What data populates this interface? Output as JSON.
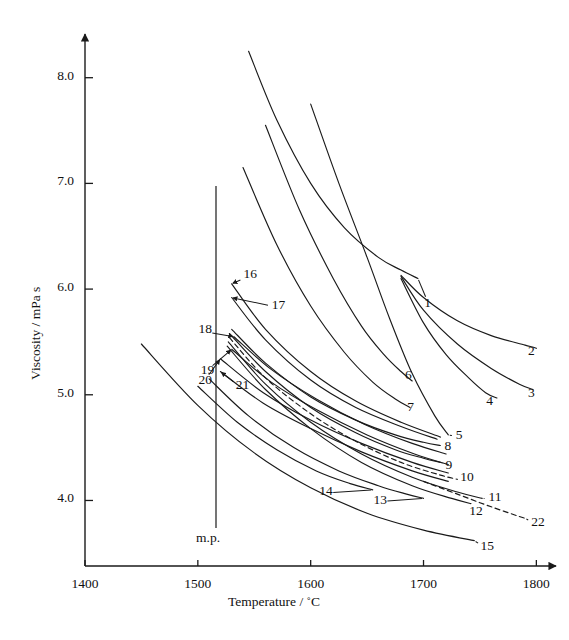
{
  "figure": {
    "kind": "scientific-line-chart",
    "background": "#ffffff",
    "ink": "#1a1a1a"
  },
  "axes": {
    "x_title": "Temperature / ˚C",
    "y_title": "Viscosity / mPa s",
    "x_ticks": [
      "1400",
      "1500",
      "1600",
      "1700",
      "1800"
    ],
    "y_ticks": [
      "8.0",
      "7.0",
      "6.0",
      "5.0",
      "4.0"
    ]
  },
  "annotations": {
    "melting_point": "m.p."
  },
  "curve_labels": [
    "1",
    "2",
    "3",
    "4",
    "5",
    "6",
    "7",
    "8",
    "9",
    "10",
    "11",
    "12",
    "13",
    "14",
    "15",
    "16",
    "17",
    "18",
    "19",
    "20",
    "21",
    "22"
  ],
  "chart_data": {
    "type": "line",
    "title": "",
    "xlabel": "Temperature / ˚C",
    "ylabel": "Viscosity / mPa s",
    "xlim": [
      1400,
      1800
    ],
    "ylim": [
      3.4,
      8.3
    ],
    "xticks": [
      1400,
      1500,
      1600,
      1700,
      1800
    ],
    "yticks": [
      4.0,
      5.0,
      6.0,
      7.0,
      8.0
    ],
    "grid": false,
    "legend": "inline-end-labels",
    "annotations": [
      {
        "text": "m.p.",
        "x": 1537,
        "note": "vertical melting-point line"
      }
    ],
    "series": [
      {
        "name": "1",
        "style": "solid",
        "label_xy": [
          1705,
          5.85
        ],
        "points": [
          [
            1545,
            8.25
          ],
          [
            1570,
            7.6
          ],
          [
            1600,
            7.0
          ],
          [
            1630,
            6.58
          ],
          [
            1660,
            6.3
          ],
          [
            1680,
            6.18
          ],
          [
            1695,
            6.1
          ]
        ]
      },
      {
        "name": "2",
        "style": "solid",
        "label_xy": [
          1797,
          5.4
        ],
        "points": [
          [
            1680,
            6.13
          ],
          [
            1700,
            5.92
          ],
          [
            1730,
            5.7
          ],
          [
            1760,
            5.56
          ],
          [
            1790,
            5.47
          ],
          [
            1800,
            5.44
          ]
        ]
      },
      {
        "name": "3",
        "style": "solid",
        "label_xy": [
          1797,
          5.0
        ],
        "points": [
          [
            1680,
            6.12
          ],
          [
            1700,
            5.8
          ],
          [
            1730,
            5.48
          ],
          [
            1760,
            5.25
          ],
          [
            1785,
            5.1
          ],
          [
            1797,
            5.05
          ]
        ]
      },
      {
        "name": "4",
        "style": "solid",
        "label_xy": [
          1760,
          4.92
        ],
        "points": [
          [
            1680,
            6.1
          ],
          [
            1700,
            5.68
          ],
          [
            1720,
            5.38
          ],
          [
            1740,
            5.16
          ],
          [
            1755,
            5.02
          ],
          [
            1765,
            4.97
          ]
        ]
      },
      {
        "name": "5",
        "style": "solid",
        "label_xy": [
          1733,
          4.6
        ],
        "points": [
          [
            1600,
            7.75
          ],
          [
            1625,
            7.0
          ],
          [
            1650,
            6.3
          ],
          [
            1670,
            5.72
          ],
          [
            1690,
            5.2
          ],
          [
            1710,
            4.8
          ],
          [
            1722,
            4.62
          ]
        ]
      },
      {
        "name": "6",
        "style": "solid",
        "label_xy": [
          1688,
          5.17
        ],
        "points": [
          [
            1560,
            7.55
          ],
          [
            1590,
            6.75
          ],
          [
            1620,
            6.1
          ],
          [
            1645,
            5.65
          ],
          [
            1665,
            5.38
          ],
          [
            1680,
            5.22
          ],
          [
            1690,
            5.13
          ]
        ]
      },
      {
        "name": "7",
        "style": "solid",
        "label_xy": [
          1690,
          4.87
        ],
        "points": [
          [
            1540,
            7.15
          ],
          [
            1570,
            6.42
          ],
          [
            1600,
            5.84
          ],
          [
            1630,
            5.4
          ],
          [
            1655,
            5.12
          ],
          [
            1675,
            4.96
          ],
          [
            1688,
            4.88
          ]
        ]
      },
      {
        "name": "8",
        "style": "solid",
        "label_xy": [
          1723,
          4.5
        ],
        "points": [
          [
            1530,
            5.62
          ],
          [
            1560,
            5.3
          ],
          [
            1600,
            4.98
          ],
          [
            1640,
            4.76
          ],
          [
            1675,
            4.62
          ],
          [
            1700,
            4.55
          ],
          [
            1715,
            4.52
          ]
        ]
      },
      {
        "name": "9",
        "style": "solid",
        "label_xy": [
          1724,
          4.32
        ],
        "points": [
          [
            1528,
            5.58
          ],
          [
            1560,
            5.22
          ],
          [
            1600,
            4.88
          ],
          [
            1640,
            4.64
          ],
          [
            1675,
            4.48
          ],
          [
            1700,
            4.4
          ],
          [
            1715,
            4.36
          ]
        ]
      },
      {
        "name": "10",
        "style": "dashed",
        "label_xy": [
          1737,
          4.2
        ],
        "points": [
          [
            1528,
            5.54
          ],
          [
            1560,
            5.16
          ],
          [
            1600,
            4.82
          ],
          [
            1640,
            4.56
          ],
          [
            1680,
            4.36
          ],
          [
            1715,
            4.24
          ],
          [
            1730,
            4.2
          ]
        ]
      },
      {
        "name": "11",
        "style": "solid",
        "label_xy": [
          1762,
          4.01
        ],
        "points": [
          [
            1527,
            5.5
          ],
          [
            1560,
            5.1
          ],
          [
            1600,
            4.74
          ],
          [
            1645,
            4.44
          ],
          [
            1690,
            4.22
          ],
          [
            1730,
            4.08
          ],
          [
            1752,
            4.02
          ]
        ]
      },
      {
        "name": "12",
        "style": "solid",
        "label_xy": [
          1745,
          3.88
        ],
        "points": [
          [
            1526,
            5.46
          ],
          [
            1560,
            5.05
          ],
          [
            1600,
            4.68
          ],
          [
            1645,
            4.36
          ],
          [
            1690,
            4.14
          ],
          [
            1725,
            4.02
          ],
          [
            1742,
            3.97
          ]
        ]
      },
      {
        "name": "13",
        "style": "solid",
        "label_xy": [
          1660,
          3.99
        ],
        "points": [
          [
            1510,
            5.15
          ],
          [
            1545,
            4.8
          ],
          [
            1585,
            4.5
          ],
          [
            1625,
            4.28
          ],
          [
            1660,
            4.14
          ],
          [
            1685,
            4.06
          ],
          [
            1700,
            4.02
          ]
        ]
      },
      {
        "name": "14",
        "style": "solid",
        "label_xy": [
          1612,
          4.07
        ],
        "points": [
          [
            1500,
            5.08
          ],
          [
            1535,
            4.74
          ],
          [
            1570,
            4.48
          ],
          [
            1605,
            4.28
          ],
          [
            1635,
            4.16
          ],
          [
            1655,
            4.1
          ]
        ]
      },
      {
        "name": "15",
        "style": "solid",
        "label_xy": [
          1755,
          3.55
        ],
        "points": [
          [
            1450,
            5.48
          ],
          [
            1500,
            4.9
          ],
          [
            1550,
            4.45
          ],
          [
            1600,
            4.12
          ],
          [
            1650,
            3.88
          ],
          [
            1700,
            3.72
          ],
          [
            1745,
            3.62
          ]
        ]
      },
      {
        "name": "16",
        "style": "solid",
        "label_xy": [
          1545,
          6.12
        ],
        "points": [
          [
            1530,
            6.05
          ],
          [
            1560,
            5.62
          ],
          [
            1600,
            5.22
          ],
          [
            1640,
            4.94
          ],
          [
            1680,
            4.74
          ],
          [
            1715,
            4.6
          ]
        ]
      },
      {
        "name": "17",
        "style": "solid",
        "label_xy": [
          1570,
          5.83
        ],
        "points": [
          [
            1530,
            5.92
          ],
          [
            1560,
            5.52
          ],
          [
            1600,
            5.14
          ],
          [
            1640,
            4.88
          ],
          [
            1680,
            4.7
          ],
          [
            1712,
            4.58
          ]
        ]
      },
      {
        "name": "18",
        "style": "solid",
        "label_xy": [
          1505,
          5.6
        ],
        "points": [
          [
            1532,
            5.55
          ],
          [
            1565,
            5.24
          ],
          [
            1605,
            4.96
          ],
          [
            1648,
            4.72
          ],
          [
            1690,
            4.54
          ],
          [
            1720,
            4.44
          ]
        ]
      },
      {
        "name": "19",
        "style": "solid",
        "label_xy": [
          1507,
          5.22
        ],
        "points": [
          [
            1530,
            5.43
          ],
          [
            1565,
            5.12
          ],
          [
            1605,
            4.86
          ],
          [
            1650,
            4.62
          ],
          [
            1692,
            4.44
          ],
          [
            1722,
            4.34
          ]
        ]
      },
      {
        "name": "20",
        "style": "solid",
        "label_xy": [
          1505,
          5.12
        ],
        "points": [
          [
            1520,
            5.34
          ],
          [
            1558,
            5.02
          ],
          [
            1600,
            4.76
          ],
          [
            1645,
            4.54
          ],
          [
            1690,
            4.36
          ],
          [
            1722,
            4.26
          ]
        ]
      },
      {
        "name": "21",
        "style": "solid",
        "label_xy": [
          1538,
          5.07
        ],
        "points": [
          [
            1520,
            5.22
          ],
          [
            1558,
            4.92
          ],
          [
            1600,
            4.68
          ],
          [
            1645,
            4.46
          ],
          [
            1690,
            4.28
          ],
          [
            1722,
            4.18
          ]
        ]
      },
      {
        "name": "22",
        "style": "dashed",
        "label_xy": [
          1800,
          3.78
        ],
        "points": [
          [
            1700,
            4.18
          ],
          [
            1730,
            4.06
          ],
          [
            1760,
            3.94
          ],
          [
            1790,
            3.83
          ]
        ]
      }
    ]
  }
}
